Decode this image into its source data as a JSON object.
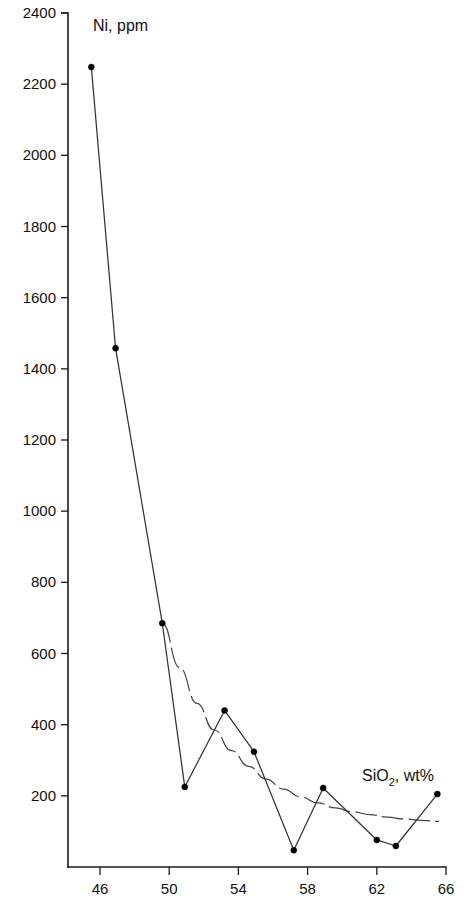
{
  "chart_data": {
    "type": "line",
    "title": "",
    "xlabel": "SiO2 , wt%",
    "xlabel_base": "SiO",
    "xlabel_sub": "2",
    "xlabel_rest": ", wt%",
    "ylabel": "Ni, ppm",
    "xlim": [
      44.0,
      66.0
    ],
    "ylim": [
      0,
      2400
    ],
    "xticks": [
      46,
      50,
      54,
      58,
      62,
      66
    ],
    "yticks": [
      200,
      400,
      600,
      800,
      1000,
      1200,
      1400,
      1600,
      1800,
      2000,
      2200,
      2400
    ],
    "grid": false,
    "legend": "none",
    "series": [
      {
        "name": "Ni vs SiO2",
        "style": "line-with-markers",
        "color": "#333333",
        "x": [
          45.5,
          46.9,
          49.6,
          50.9,
          53.2,
          54.9,
          57.2,
          58.9,
          62.0,
          63.1,
          65.5
        ],
        "y": [
          2248,
          1458,
          685,
          225,
          440,
          324,
          47,
          222,
          76,
          59,
          205
        ]
      },
      {
        "name": "trend curve",
        "style": "dashed-curve",
        "color": "#444444",
        "x": [
          49.6,
          50.6,
          51.6,
          52.6,
          53.6,
          54.6,
          55.6,
          56.6,
          57.6,
          58.6,
          59.6,
          60.6,
          61.6,
          62.6,
          63.6,
          64.6,
          65.6
        ],
        "y": [
          685,
          560,
          460,
          385,
          327,
          283,
          247,
          219,
          197,
          180,
          166,
          155,
          147,
          140,
          135,
          131,
          128
        ]
      }
    ]
  },
  "axis_titles": {
    "y_label": "Ni, ppm",
    "x_label_base": "SiO",
    "x_label_sub": "2",
    "x_label_rest": ", wt%"
  }
}
